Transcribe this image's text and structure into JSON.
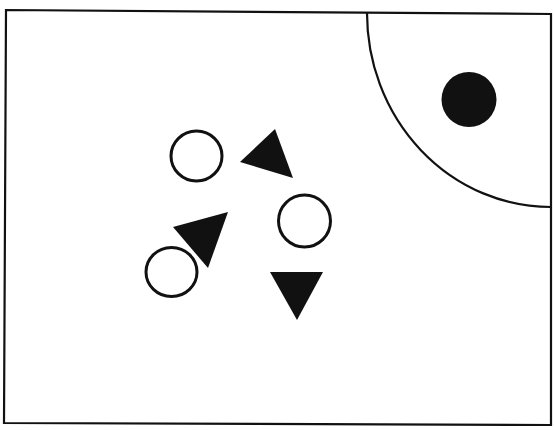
{
  "colors": {
    "background": "#ffffff",
    "ink": "#111111",
    "fill": "#111111"
  },
  "frame": {
    "points": [
      [
        6,
        10
      ],
      [
        551,
        14
      ],
      [
        551,
        425
      ],
      [
        4,
        423
      ]
    ],
    "stroke_width": 2.2
  },
  "region": {
    "label": "quarter-arc-region",
    "start": [
      367,
      13
    ],
    "end": [
      551,
      207
    ],
    "rx": 184,
    "ry": 194,
    "stroke_width": 2.2
  },
  "shapes": {
    "filled_circles": [
      {
        "name": "filled-circle-in-region",
        "cx": 469,
        "cy": 99.5,
        "r": 27.5
      }
    ],
    "hollow_circles": [
      {
        "name": "hollow-circle-upper",
        "cx": 196.5,
        "cy": 156,
        "rx": 25.5,
        "ry": 25,
        "stroke_width": 3
      },
      {
        "name": "hollow-circle-right",
        "cx": 304.5,
        "cy": 221,
        "rx": 26,
        "ry": 26,
        "stroke_width": 3
      },
      {
        "name": "hollow-circle-lower",
        "cx": 171.5,
        "cy": 272,
        "rx": 25.5,
        "ry": 24.5,
        "stroke_width": 3
      }
    ],
    "triangles": [
      {
        "name": "triangle-upper",
        "points": [
          [
            275,
            129
          ],
          [
            240,
            162
          ],
          [
            293,
            178
          ]
        ]
      },
      {
        "name": "triangle-middle",
        "points": [
          [
            173,
            227
          ],
          [
            228,
            212
          ],
          [
            208,
            268
          ]
        ]
      },
      {
        "name": "triangle-down",
        "points": [
          [
            270,
            272
          ],
          [
            323,
            272
          ],
          [
            297,
            320
          ]
        ]
      }
    ]
  }
}
